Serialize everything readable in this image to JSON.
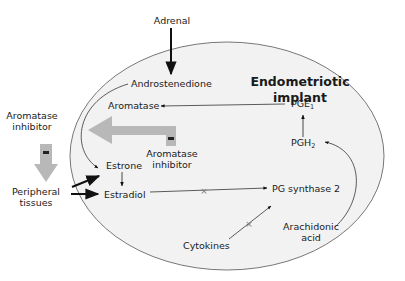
{
  "diagram": {
    "title_line1": "Endometriotic",
    "title_line2": "implant",
    "nodes": {
      "adrenal": "Adrenal",
      "androstenedione": "Androstenedione",
      "aromatase": "Aromatase",
      "pge1_base": "PGE",
      "pge1_sub": "1",
      "pgh2_base": "PGH",
      "pgh2_sub": "2",
      "estrone": "Estrone",
      "estradiol": "Estradiol",
      "pg_synthase": "PG synthase 2",
      "cytokines": "Cytokines",
      "arachidonic_line1": "Arachidonic",
      "arachidonic_line2": "acid",
      "inner_inhibitor_line1": "Aromatase",
      "inner_inhibitor_line2": "inhibitor",
      "outer_inhibitor_line1": "Aromatase",
      "outer_inhibitor_line2": "inhibitor",
      "peripheral_line1": "Peripheral",
      "peripheral_line2": "tissues"
    },
    "inhibit_symbol": "−",
    "colors": {
      "implant_fill": "#f2f2f2",
      "outline": "#555555",
      "inhibitor_arrow": "#b8b8b8",
      "text": "#1a1a1a"
    }
  }
}
